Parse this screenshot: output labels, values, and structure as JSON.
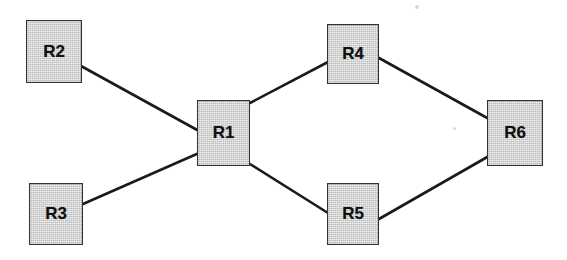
{
  "diagram": {
    "type": "network-topology",
    "title": "",
    "background_color": "#ffffff",
    "node_fill_color": "#d2d2d2",
    "node_border_color": "#333333",
    "edge_color": "#1a1a1a",
    "edge_width": 2.6,
    "nodes": [
      {
        "id": "R2",
        "label": "R2",
        "x": 26,
        "y": 20,
        "width": 56,
        "height": 63
      },
      {
        "id": "R3",
        "label": "R3",
        "x": 29,
        "y": 183,
        "width": 54,
        "height": 62
      },
      {
        "id": "R1",
        "label": "R1",
        "x": 197,
        "y": 100,
        "width": 53,
        "height": 66
      },
      {
        "id": "R4",
        "label": "R4",
        "x": 327,
        "y": 24,
        "width": 52,
        "height": 60
      },
      {
        "id": "R5",
        "label": "R5",
        "x": 327,
        "y": 183,
        "width": 52,
        "height": 62
      },
      {
        "id": "R6",
        "label": "R6",
        "x": 487,
        "y": 100,
        "width": 56,
        "height": 66
      }
    ],
    "edges": [
      {
        "from": "R2",
        "to": "R1",
        "x1": 81,
        "y1": 66,
        "x2": 199,
        "y2": 131
      },
      {
        "from": "R3",
        "to": "R1",
        "x1": 83,
        "y1": 204,
        "x2": 199,
        "y2": 153
      },
      {
        "from": "R1",
        "to": "R4",
        "x1": 250,
        "y1": 103,
        "x2": 328,
        "y2": 62
      },
      {
        "from": "R1",
        "to": "R5",
        "x1": 250,
        "y1": 164,
        "x2": 328,
        "y2": 213
      },
      {
        "from": "R4",
        "to": "R6",
        "x1": 379,
        "y1": 58,
        "x2": 489,
        "y2": 119
      },
      {
        "from": "R5",
        "to": "R6",
        "x1": 379,
        "y1": 219,
        "x2": 489,
        "y2": 156
      }
    ],
    "artifacts": [
      {
        "x": 415,
        "y": 5,
        "size": 4
      },
      {
        "x": 231,
        "y": 120,
        "size": 3
      },
      {
        "x": 453,
        "y": 127,
        "size": 3
      },
      {
        "x": 499,
        "y": 127,
        "size": 3
      }
    ]
  }
}
